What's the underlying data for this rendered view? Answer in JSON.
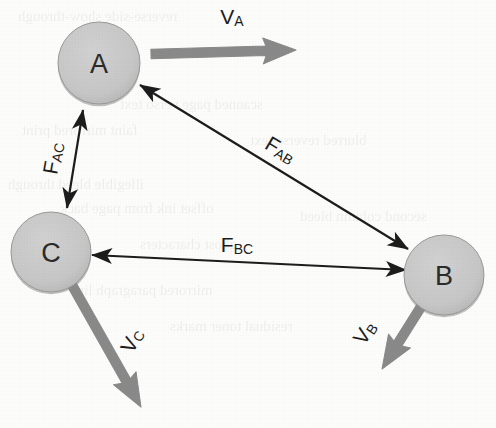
{
  "figure": {
    "background_color": "#fdfdfc",
    "width": 496,
    "height": 428
  },
  "style": {
    "node_fill": "#c8c8c8",
    "node_edge": "#9a9a9a",
    "node_shadow": "#8e8e8e",
    "force_arrow_color": "#1d1d1d",
    "velocity_arrow_color": "#8a8a8a",
    "label_color": "#1d1d1d"
  },
  "nodes": [
    {
      "id": "A",
      "label": "A",
      "cx": 99,
      "cy": 63,
      "r": 41
    },
    {
      "id": "C",
      "label": "C",
      "cx": 51,
      "cy": 252,
      "r": 40
    },
    {
      "id": "B",
      "label": "B",
      "cx": 444,
      "cy": 275,
      "r": 40
    }
  ],
  "force_vectors": [
    {
      "id": "F_AC",
      "base": "F",
      "subscript": "AC",
      "from": "C",
      "to": "A",
      "double_headed": true,
      "x1": 83,
      "y1": 110,
      "x2": 67,
      "y2": 208,
      "label_x": 52,
      "label_y": 158,
      "label_rotation": -80
    },
    {
      "id": "F_AB",
      "base": "F",
      "subscript": "AB",
      "from": "A",
      "to": "B",
      "double_headed": true,
      "x1": 140,
      "y1": 85,
      "x2": 408,
      "y2": 249,
      "label_x": 281,
      "label_y": 149,
      "label_rotation": 31
    },
    {
      "id": "F_BC",
      "base": "F",
      "subscript": "BC",
      "from": "B",
      "to": "C",
      "double_headed": true,
      "x1": 92,
      "y1": 255,
      "x2": 406,
      "y2": 270,
      "label_x": 237,
      "label_y": 244,
      "label_rotation": 0
    }
  ],
  "velocity_vectors": [
    {
      "id": "V_A",
      "base": "V",
      "subscript": "A",
      "node": "A",
      "x1": 151,
      "y1": 54,
      "x2": 296,
      "y2": 50,
      "label_x": 232,
      "label_y": 16,
      "label_rotation": 0
    },
    {
      "id": "V_B",
      "base": "V",
      "subscript": "B",
      "node": "B",
      "x1": 424,
      "y1": 302,
      "x2": 382,
      "y2": 369,
      "label_x": 364,
      "label_y": 332,
      "label_rotation": -56
    },
    {
      "id": "V_C",
      "base": "V",
      "subscript": "C",
      "node": "C",
      "x1": 72,
      "y1": 285,
      "x2": 141,
      "y2": 407,
      "label_x": 131,
      "label_y": 340,
      "label_rotation": -62
    }
  ],
  "background_bleed": [
    {
      "text": "reverse-side show-through",
      "x": 18,
      "y": 8,
      "size": 15
    },
    {
      "text": "scanned page verso text",
      "x": 120,
      "y": 96,
      "size": 15
    },
    {
      "text": "faint mirrored print",
      "x": 22,
      "y": 122,
      "size": 15
    },
    {
      "text": "illegible bleed through",
      "x": 8,
      "y": 176,
      "size": 15
    },
    {
      "text": "offset ink from page back",
      "x": 60,
      "y": 200,
      "size": 15
    },
    {
      "text": "ghost characters",
      "x": 140,
      "y": 236,
      "size": 15
    },
    {
      "text": "mirrored paragraph line",
      "x": 70,
      "y": 282,
      "size": 15
    },
    {
      "text": "residual toner marks",
      "x": 170,
      "y": 318,
      "size": 15
    },
    {
      "text": "blurred reverse text",
      "x": 250,
      "y": 132,
      "size": 15
    },
    {
      "text": "second column bleed",
      "x": 300,
      "y": 208,
      "size": 15
    }
  ]
}
